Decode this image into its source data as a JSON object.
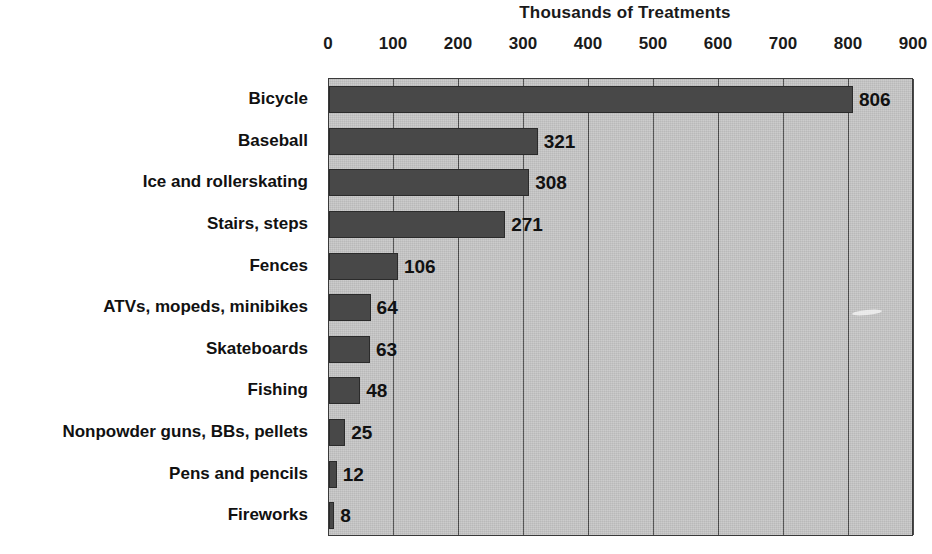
{
  "chart_data": {
    "type": "bar",
    "orientation": "horizontal",
    "title": "Thousands of Treatments",
    "xlabel": "",
    "ylabel": "",
    "xlim": [
      0,
      900
    ],
    "xticks": [
      0,
      100,
      200,
      300,
      400,
      500,
      600,
      700,
      800,
      900
    ],
    "xtick_labels": [
      "0",
      "100",
      "200",
      "300",
      "400",
      "500",
      "600",
      "700",
      "800",
      "900"
    ],
    "grid": true,
    "legend": null,
    "categories": [
      "Bicycle",
      "Baseball",
      "Ice and rollerskating",
      "Stairs, steps",
      "Fences",
      "ATVs, mopeds, minibikes",
      "Skateboards",
      "Fishing",
      "Nonpowder guns, BBs, pellets",
      "Pens and pencils",
      "Fireworks"
    ],
    "values": [
      806,
      321,
      308,
      271,
      106,
      64,
      63,
      48,
      25,
      12,
      8
    ],
    "value_labels": [
      "806",
      "321",
      "308",
      "271",
      "106",
      "64",
      "63",
      "48",
      "25",
      "12",
      "8"
    ],
    "colors": {
      "bar": "#484848",
      "bar_border": "#2b2b2b",
      "plot_background": "#c6c6c6",
      "gridline": "#4a4a4a",
      "text": "#111111",
      "page_background": "#ffffff"
    }
  }
}
